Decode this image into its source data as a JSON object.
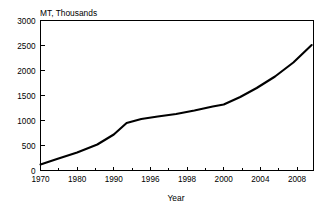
{
  "chart_data": {
    "type": "line",
    "title": "",
    "ylabel": "MT, Thousands",
    "xlabel": "Year",
    "grid": false,
    "legend": false,
    "ylim": [
      0,
      3000
    ],
    "yticks": [
      0,
      500,
      1000,
      1500,
      2000,
      2500,
      3000
    ],
    "ytick_labels": [
      "0",
      "500",
      "1000",
      "1500",
      "2000",
      "2500",
      "3000"
    ],
    "xtick_labels": [
      "1970",
      "1980",
      "1990",
      "1996",
      "1998",
      "2000",
      "2004",
      "2008"
    ],
    "xtick_positions": [
      0,
      1,
      2,
      3,
      4,
      5,
      6,
      7
    ],
    "x": [
      0,
      0.45,
      1.0,
      1.55,
      2.0,
      2.35,
      2.75,
      3.2,
      3.7,
      4.2,
      4.7,
      5.0,
      5.45,
      5.9,
      6.4,
      6.9,
      7.4
    ],
    "x_year_labels": [
      "1970",
      "1975",
      "1980",
      "1985",
      "1990",
      "1993",
      "1996",
      "1997",
      "1998",
      "1999",
      "2000",
      "2000",
      "2002",
      "2004",
      "2006",
      "2008",
      "2010"
    ],
    "values": [
      120,
      230,
      360,
      520,
      720,
      950,
      1030,
      1080,
      1130,
      1200,
      1280,
      1320,
      1470,
      1650,
      1880,
      2160,
      2510
    ],
    "series": [
      {
        "name": "Production",
        "values": [
          120,
          230,
          360,
          520,
          720,
          950,
          1030,
          1080,
          1130,
          1200,
          1280,
          1320,
          1470,
          1650,
          1880,
          2160,
          2510
        ]
      }
    ],
    "annotations": []
  }
}
